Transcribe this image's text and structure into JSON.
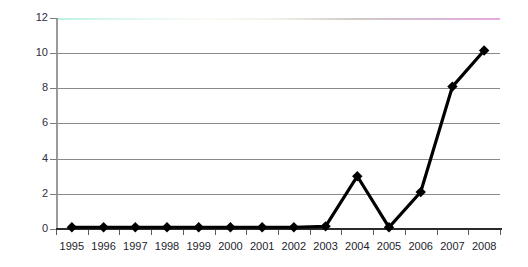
{
  "chart_data": {
    "type": "line",
    "title": "",
    "subtitle": "",
    "xlabel": "",
    "ylabel": "",
    "categories": [
      "1995",
      "1996",
      "1997",
      "1998",
      "1999",
      "2000",
      "2001",
      "2002",
      "2003",
      "2004",
      "2005",
      "2006",
      "2007",
      "2008"
    ],
    "series": [
      {
        "name": "series-1",
        "values": [
          0.1,
          0.1,
          0.1,
          0.1,
          0.1,
          0.1,
          0.1,
          0.1,
          0.15,
          3.0,
          0.1,
          2.1,
          8.1,
          10.15
        ],
        "color": "#000000",
        "marker": "diamond",
        "marker_color": "#000000"
      }
    ],
    "ylim": [
      0,
      12
    ],
    "ytick_values": [
      0,
      2,
      4,
      6,
      8,
      10,
      12
    ],
    "ytick_labels": [
      "0",
      "2",
      "4",
      "6",
      "8",
      "10",
      "12"
    ],
    "grid": true,
    "grid_color": "#8a8a8a",
    "top_gridline_tint_left": "#b9f2e6",
    "top_gridline_tint_right": "#e6a8e0",
    "axis_color": "#2b2b2b",
    "y_axis_color": "#9a9a9a",
    "legend": false,
    "legend_position": "none",
    "background": "#ffffff"
  }
}
